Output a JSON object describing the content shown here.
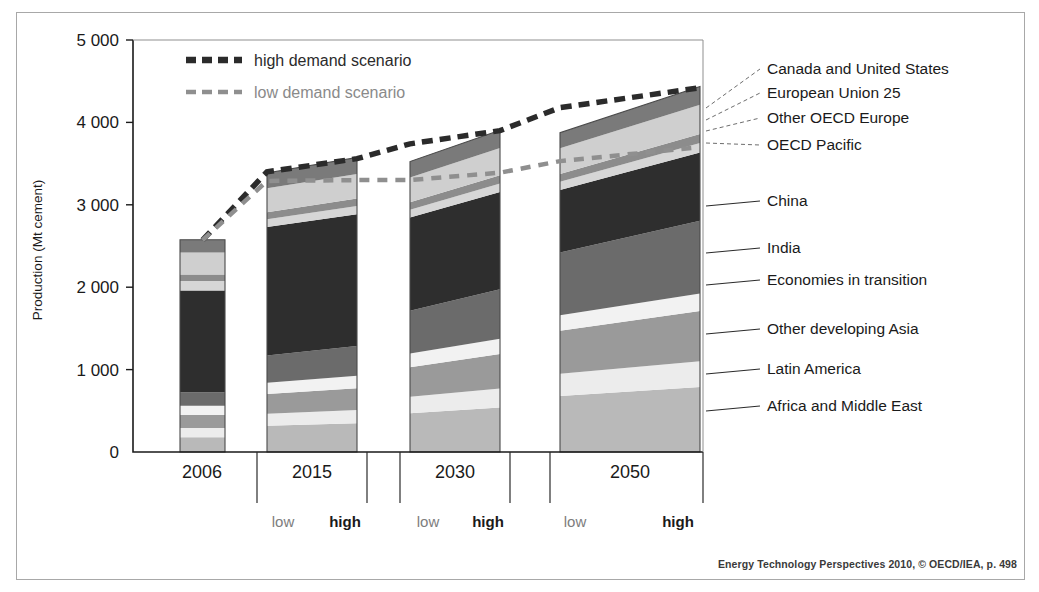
{
  "figure": {
    "credit": "Energy Technology Perspectives 2010, © OECD/IEA, p. 498"
  },
  "legend": {
    "high_label": "high demand scenario",
    "low_label": "low demand scenario",
    "high_color": "#2b2b2b",
    "low_color": "#8f8f8f"
  },
  "scenario_axis": {
    "low": "low",
    "high": "high"
  },
  "chart_data": {
    "type": "area",
    "title": "",
    "xlabel": "",
    "ylabel": "Production (Mt cement)",
    "ylim": [
      0,
      5000
    ],
    "yticks": [
      0,
      1000,
      2000,
      3000,
      4000,
      5000
    ],
    "ytick_labels": [
      "0",
      "1 000",
      "2 000",
      "3 000",
      "4 000",
      "5 000"
    ],
    "grid": false,
    "legend_position": "top-left",
    "categories": [
      "2006",
      "2015",
      "2030",
      "2050"
    ],
    "scenarios": [
      "low",
      "high"
    ],
    "series": [
      {
        "name": "Africa and Middle East",
        "color": "#b9b9b9",
        "values": {
          "2006": 180,
          "2015_low": 320,
          "2015_high": 350,
          "2030_low": 470,
          "2030_high": 540,
          "2050_low": 680,
          "2050_high": 790
        }
      },
      {
        "name": "Latin America",
        "color": "#ececec",
        "values": {
          "2006": 110,
          "2015_low": 145,
          "2015_high": 160,
          "2030_low": 200,
          "2030_high": 230,
          "2050_low": 270,
          "2050_high": 310
        }
      },
      {
        "name": "Other developing Asia",
        "color": "#9a9a9a",
        "values": {
          "2006": 160,
          "2015_low": 240,
          "2015_high": 265,
          "2030_low": 360,
          "2030_high": 420,
          "2050_low": 520,
          "2050_high": 610
        }
      },
      {
        "name": "Economies in transition",
        "color": "#f2f2f2",
        "values": {
          "2006": 110,
          "2015_low": 135,
          "2015_high": 150,
          "2030_low": 165,
          "2030_high": 185,
          "2050_low": 190,
          "2050_high": 215
        }
      },
      {
        "name": "India",
        "color": "#6b6b6b",
        "values": {
          "2006": 165,
          "2015_low": 330,
          "2015_high": 360,
          "2030_low": 520,
          "2030_high": 600,
          "2050_low": 760,
          "2050_high": 880
        }
      },
      {
        "name": "China",
        "color": "#2e2e2e",
        "values": {
          "2006": 1235,
          "2015_low": 1560,
          "2015_high": 1600,
          "2030_low": 1130,
          "2030_high": 1180,
          "2050_low": 760,
          "2050_high": 830
        }
      },
      {
        "name": "OECD Pacific",
        "color": "#d6d6d6",
        "values": {
          "2006": 115,
          "2015_low": 95,
          "2015_high": 100,
          "2030_low": 95,
          "2030_high": 105,
          "2050_low": 100,
          "2050_high": 115
        }
      },
      {
        "name": "Other OECD Europe",
        "color": "#8c8c8c",
        "values": {
          "2006": 80,
          "2015_low": 85,
          "2015_high": 90,
          "2030_low": 90,
          "2030_high": 100,
          "2050_low": 95,
          "2050_high": 110
        }
      },
      {
        "name": "European Union 25",
        "color": "#cfcfcf",
        "values": {
          "2006": 265,
          "2015_low": 290,
          "2015_high": 300,
          "2030_low": 300,
          "2030_high": 330,
          "2050_low": 310,
          "2050_high": 355
        }
      },
      {
        "name": "Canada and United States",
        "color": "#7a7a7a",
        "values": {
          "2006": 155,
          "2015_low": 185,
          "2015_high": 200,
          "2030_low": 195,
          "2030_high": 215,
          "2050_low": 190,
          "2050_high": 220
        }
      }
    ],
    "totals": {
      "2006": 2575,
      "2015_low": 3385,
      "2015_high": 3575,
      "2030_low": 3525,
      "2030_high": 3905,
      "2050_low": 3875,
      "2050_high": 4435
    },
    "trend_lines": [
      {
        "name": "high demand scenario",
        "style": "dashed",
        "color": "#2b2b2b",
        "points": [
          {
            "x": "2006",
            "y": 2570
          },
          {
            "x": "2015_low",
            "y": 3400
          },
          {
            "x": "2015_high",
            "y": 3560
          },
          {
            "x": "2030_low",
            "y": 3740
          },
          {
            "x": "2030_high",
            "y": 3900
          },
          {
            "x": "2050_low",
            "y": 4180
          },
          {
            "x": "2050_high",
            "y": 4420
          }
        ]
      },
      {
        "name": "low demand scenario",
        "style": "dashed",
        "color": "#8f8f8f",
        "points": [
          {
            "x": "2006",
            "y": 2570
          },
          {
            "x": "2015_low",
            "y": 3290
          },
          {
            "x": "2015_high",
            "y": 3300
          },
          {
            "x": "2030_low",
            "y": 3300
          },
          {
            "x": "2030_high",
            "y": 3390
          },
          {
            "x": "2050_low",
            "y": 3530
          },
          {
            "x": "2050_high",
            "y": 3700
          }
        ]
      }
    ],
    "region_labels": [
      {
        "label": "Canada and United States",
        "y": 74
      },
      {
        "label": "European Union 25",
        "y": 98
      },
      {
        "label": "Other OECD Europe",
        "y": 123
      },
      {
        "label": "OECD Pacific",
        "y": 150
      },
      {
        "label": "China",
        "y": 206
      },
      {
        "label": "India",
        "y": 253
      },
      {
        "label": "Economies in transition",
        "y": 285
      },
      {
        "label": "Other developing Asia",
        "y": 334
      },
      {
        "label": "Latin America",
        "y": 374
      },
      {
        "label": "Africa and Middle East",
        "y": 411
      }
    ]
  }
}
